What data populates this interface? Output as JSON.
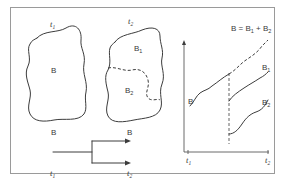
{
  "figure": {
    "panel_left": {
      "time_label": "t",
      "time_sub": "1",
      "region_label": "B"
    },
    "panel_middle": {
      "time_label": "t",
      "time_sub": "2",
      "region_top_label": "B",
      "region_top_sub": "1",
      "region_bottom_label": "B",
      "region_bottom_sub": "2"
    },
    "branch": {
      "source_label": "B",
      "target_label": "B",
      "start_time": "t",
      "start_time_sub": "1",
      "end_time": "t",
      "end_time_sub": "2"
    },
    "graph": {
      "sum_label_prefix": "B = B",
      "sum_sub_1": "1",
      "sum_plus": " + B",
      "sum_sub_2": "2",
      "curve_b": "B",
      "curve_b1": "B",
      "curve_b1_sub": "1",
      "curve_b2": "B",
      "curve_b2_sub": "2",
      "x_tick_1": "t",
      "x_tick_1_sub": "1",
      "x_tick_2": "t",
      "x_tick_2_sub": "2"
    }
  },
  "colors": {
    "line": "#3c3c3c",
    "frame": "#9a9a9a",
    "background": "#ffffff"
  }
}
